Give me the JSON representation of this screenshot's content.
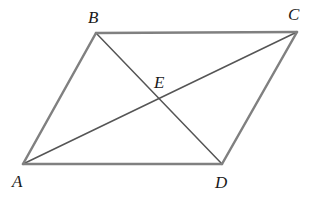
{
  "figure": {
    "name": "parallelogram-with-diagonals",
    "background_color": "#ffffff",
    "side_color": "#808080",
    "diagonal_color": "#555555",
    "label_color": "#1a1a1a",
    "side_width": 2.5,
    "diagonal_width": 1.5,
    "points": {
      "A": {
        "label": "A",
        "x": 23,
        "y": 164
      },
      "B": {
        "label": "B",
        "x": 96,
        "y": 33
      },
      "C": {
        "label": "C",
        "x": 297,
        "y": 32
      },
      "D": {
        "label": "D",
        "x": 222,
        "y": 164
      },
      "E": {
        "label": "E",
        "x": 160,
        "y": 98
      }
    },
    "sides": [
      {
        "name": "side-AB",
        "from": "A",
        "to": "B"
      },
      {
        "name": "side-BC",
        "from": "B",
        "to": "C"
      },
      {
        "name": "side-CD",
        "from": "C",
        "to": "D"
      },
      {
        "name": "side-DA",
        "from": "D",
        "to": "A"
      }
    ],
    "diagonals": [
      {
        "name": "diagonal-AC",
        "from": "A",
        "to": "C"
      },
      {
        "name": "diagonal-BD",
        "from": "B",
        "to": "D"
      }
    ]
  }
}
